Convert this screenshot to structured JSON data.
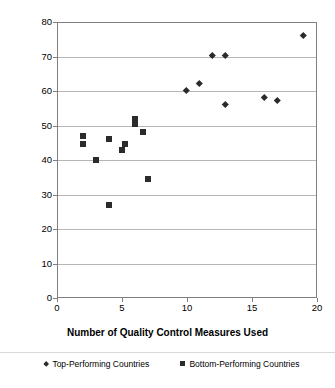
{
  "chart_data": {
    "type": "scatter",
    "title": "",
    "xlabel": "Number of Quality Control Measures Used",
    "ylabel": "",
    "xlim": [
      0,
      20
    ],
    "ylim": [
      0,
      80
    ],
    "xticks": [
      0,
      5,
      10,
      15,
      20
    ],
    "yticks": [
      0,
      10,
      20,
      30,
      40,
      50,
      60,
      70,
      80
    ],
    "grid": "horizontal",
    "legend_position": "bottom",
    "series": [
      {
        "name": "Top-Performing Countries",
        "marker": "diamond",
        "color": "#2b2b2b",
        "points": [
          {
            "x": 10,
            "y": 60
          },
          {
            "x": 11,
            "y": 62
          },
          {
            "x": 12,
            "y": 70
          },
          {
            "x": 13,
            "y": 70
          },
          {
            "x": 13,
            "y": 56
          },
          {
            "x": 16,
            "y": 58
          },
          {
            "x": 17,
            "y": 57
          },
          {
            "x": 19,
            "y": 76
          }
        ]
      },
      {
        "name": "Bottom-Performing Countries",
        "marker": "square",
        "color": "#2b2b2b",
        "points": [
          {
            "x": 2,
            "y": 47
          },
          {
            "x": 2,
            "y": 44.5
          },
          {
            "x": 3,
            "y": 40
          },
          {
            "x": 4,
            "y": 27
          },
          {
            "x": 4,
            "y": 46
          },
          {
            "x": 5,
            "y": 43
          },
          {
            "x": 5.2,
            "y": 44.5
          },
          {
            "x": 6,
            "y": 52
          },
          {
            "x": 6,
            "y": 50.5
          },
          {
            "x": 6.6,
            "y": 48
          },
          {
            "x": 7,
            "y": 34.5
          }
        ]
      }
    ]
  },
  "legend": {
    "entries": [
      {
        "label": "Top-Performing Countries",
        "marker": "diamond"
      },
      {
        "label": "Bottom-Performing Countries",
        "marker": "square"
      }
    ]
  }
}
